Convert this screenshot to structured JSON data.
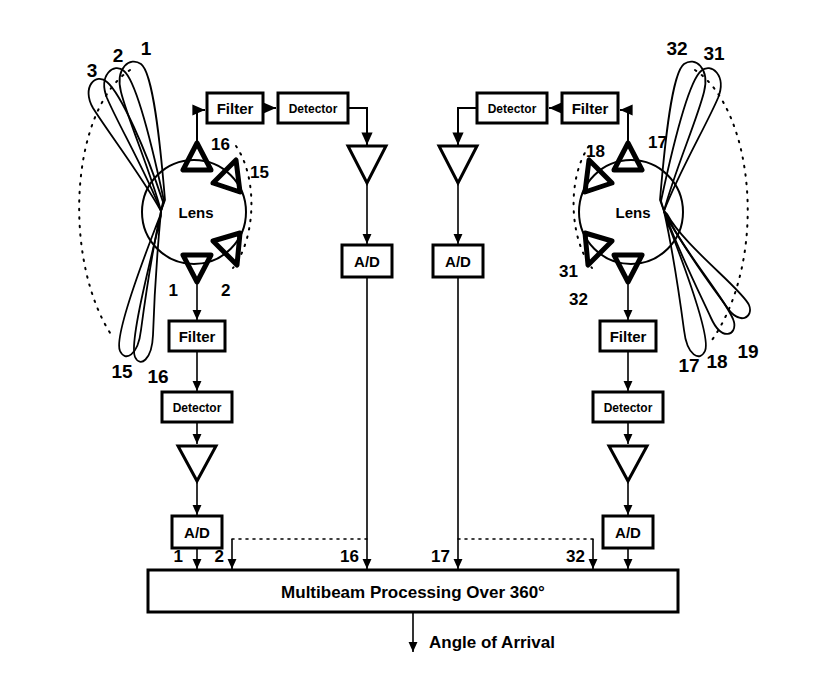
{
  "figure": {
    "background": "#ffffff",
    "ink": "#000000"
  },
  "processing": {
    "label": "Multibeam Processing Over 360°",
    "output_label": "Angle of Arrival",
    "channel_labels": [
      "1",
      "2",
      "16",
      "17",
      "32"
    ]
  },
  "lenses": {
    "left": {
      "label": "Lens",
      "horn_labels": {
        "top_outer": "16",
        "top_inner": "15",
        "bottom_outer": "1",
        "bottom_inner": "2"
      },
      "beam_labels_upper": [
        "3",
        "2",
        "1"
      ],
      "beam_labels_lower": [
        "15",
        "16"
      ]
    },
    "right": {
      "label": "Lens",
      "horn_labels": {
        "top_outer": "17",
        "top_inner": "18",
        "bottom_outer": "32",
        "bottom_inner": "31"
      },
      "beam_labels_upper": [
        "32",
        "31"
      ],
      "beam_labels_lower": [
        "17",
        "18",
        "19"
      ]
    }
  },
  "chains": {
    "filter_label": "Filter",
    "detector_label": "Detector",
    "adc_label": "A/D",
    "amplifier_name": "amplifier-triangle",
    "items": [
      {
        "id": "left-upper",
        "filter": "Filter",
        "detector": "Detector",
        "adc": "A/D",
        "channel": "16"
      },
      {
        "id": "left-lower",
        "filter": "Filter",
        "detector": "Detector",
        "adc": "A/D",
        "channel": "1"
      },
      {
        "id": "right-upper",
        "filter": "Filter",
        "detector": "Detector",
        "adc": "A/D",
        "channel": "17"
      },
      {
        "id": "right-lower",
        "filter": "Filter",
        "detector": "Detector",
        "adc": "A/D",
        "channel": "32"
      }
    ]
  }
}
